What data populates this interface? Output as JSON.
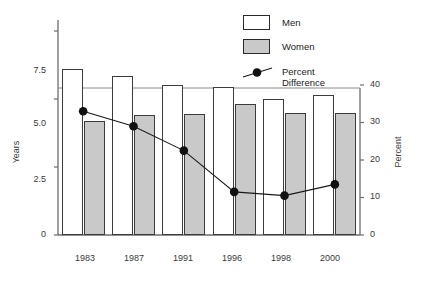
{
  "chart_data": {
    "type": "bar",
    "title": "",
    "subtitle": "",
    "categories": [
      "1983",
      "1987",
      "1991",
      "1996",
      "1998",
      "2000"
    ],
    "series": [
      {
        "name": "Men",
        "axis": "left",
        "unit": "Years",
        "color": "#ffffff",
        "values": [
          6.1,
          5.85,
          5.5,
          5.45,
          5.0,
          5.15
        ]
      },
      {
        "name": "Women",
        "axis": "left",
        "unit": "Years",
        "color": "#c9c9c9",
        "values": [
          4.2,
          4.4,
          4.45,
          4.8,
          4.5,
          4.5
        ]
      },
      {
        "name": "Percent Difference",
        "axis": "right",
        "unit": "Percent",
        "color": "#000000",
        "type": "line",
        "marker": "filled-circle",
        "values": [
          33,
          29,
          22.5,
          11.5,
          10.5,
          13.5
        ]
      }
    ],
    "xlabel": "",
    "ylabel": "Years",
    "y2label": "Percent",
    "ylim": [
      0,
      7.5
    ],
    "y2lim": [
      0,
      40
    ],
    "yticks": [
      "0",
      "2.5",
      "5.0",
      "7.5"
    ],
    "ytick_values": [
      0,
      2.5,
      5.0,
      7.5
    ],
    "y2ticks": [
      "0",
      "10",
      "20",
      "30",
      "40"
    ],
    "y2tick_values": [
      0,
      10,
      20,
      30,
      40
    ],
    "grid": false,
    "legend_position": "top-right",
    "legend": [
      "Men",
      "Women",
      "Percent Difference"
    ]
  },
  "axes": {
    "left_title": "Years",
    "right_title": "Percent",
    "left_ticks": [
      "7.5",
      "5.0",
      "2.5",
      "0"
    ],
    "right_ticks": [
      "40",
      "30",
      "20",
      "10",
      "0"
    ],
    "category_labels": [
      "1983",
      "1987",
      "1991",
      "1996",
      "1998",
      "2000"
    ]
  },
  "legend": {
    "men_label": "Men",
    "women_label": "Women",
    "percent_line1": "Percent",
    "percent_line2": "Difference",
    "men_swatch": "men-swatch-white",
    "women_swatch": "women-swatch-gray",
    "percent_marker": "line-with-dot-marker"
  }
}
